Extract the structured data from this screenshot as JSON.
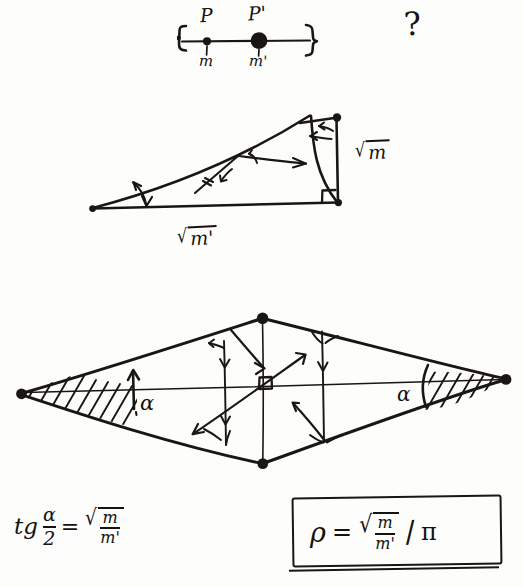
{
  "page": {
    "background_color": "#fdfdfc",
    "ink_color": "#1a1713",
    "width": 523,
    "height": 587
  },
  "top_figure": {
    "name": "two-point-mass-segment",
    "point_left_label": "P",
    "point_right_label": "P'",
    "mass_left_label": "m",
    "mass_right_label": "m'",
    "question_mark": "?"
  },
  "triangle_figure": {
    "name": "right-triangle-with-legs",
    "leg_vertical_label": "√m",
    "leg_horizontal_label": "√m'",
    "radical_vertical": {
      "sign": "√",
      "radicand": "m"
    },
    "radical_horizontal": {
      "sign": "√",
      "radicand": "m'"
    },
    "has_right_angle_marker": true,
    "angle_marker_count": 3
  },
  "rhombus_figure": {
    "name": "lens-rhombus-field-diagram",
    "angle_left_label": "α",
    "angle_right_label": "α",
    "has_right_angle_marker": true,
    "hatched_regions": 2,
    "vertical_chords": 3,
    "diagonal_arrows": 2
  },
  "formula_left": {
    "name": "tangent-half-angle-formula",
    "lhs_function": "tg",
    "lhs_numerator": "α",
    "lhs_denominator": "2",
    "equals": "=",
    "radical_sign": "√",
    "rhs_numerator": "m",
    "rhs_denominator": "m'"
  },
  "formula_boxed": {
    "name": "rho-boxed-result",
    "lhs": "ρ",
    "equals": "=",
    "radical_sign": "√",
    "rhs_numerator": "m",
    "rhs_denominator": "m'",
    "divider": "/",
    "divisor": "π",
    "boxed": true,
    "double_underlined": true
  }
}
